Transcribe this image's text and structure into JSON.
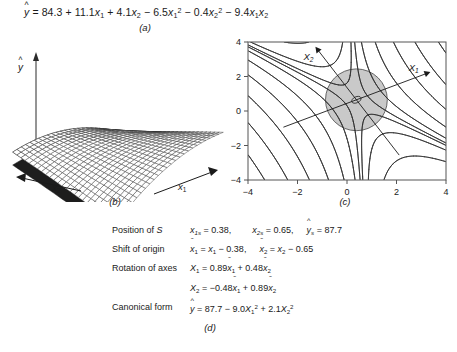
{
  "figure": {
    "panels": [
      "a",
      "b",
      "c",
      "d"
    ],
    "captions": {
      "a": "(a)",
      "b": "(b)",
      "c": "(c)",
      "d": "(d)"
    }
  },
  "equation_a": {
    "lhs": "ŷ",
    "text": "ŷ = 84.3 + 11.1x₁ + 4.1x₂ − 6.5x₁² − 0.4x₂² − 9.4x₁x₂",
    "intercept": "84.3",
    "terms": [
      {
        "coef": "11.1",
        "var": "x",
        "sub": "1",
        "pow": "",
        "sign": "+"
      },
      {
        "coef": "4.1",
        "var": "x",
        "sub": "2",
        "pow": "",
        "sign": "+"
      },
      {
        "coef": "6.5",
        "var": "x",
        "sub": "1",
        "pow": "2",
        "sign": "−"
      },
      {
        "coef": "0.4",
        "var": "x",
        "sub": "2",
        "pow": "2",
        "sign": "−"
      },
      {
        "coef": "9.4",
        "var": "x₁x₂",
        "sub": "",
        "pow": "",
        "sign": "−"
      }
    ]
  },
  "surface_b": {
    "y_axis_label": "ŷ",
    "x1_label": "x₁",
    "x2_label": "x₂",
    "description": "saddle-shaped response surface mesh"
  },
  "chart_data": {
    "type": "line",
    "title": "",
    "xlabel": "",
    "ylabel": "",
    "xlim": [
      -4,
      4
    ],
    "ylim": [
      -4,
      4
    ],
    "xticks": [
      "-4",
      "-2",
      "0",
      "2",
      "4"
    ],
    "yticks": [
      "4",
      "2",
      "0",
      "-2",
      "-4"
    ],
    "grid": false,
    "legend": null,
    "annotations": [
      {
        "text": "X₁",
        "x": 3.0,
        "y": 3.5,
        "kind": "axis-arrow-label"
      },
      {
        "text": "X₂",
        "x": -1.1,
        "y": 3.4,
        "kind": "axis-arrow-label"
      }
    ],
    "stationary_point": {
      "x1": 0.38,
      "x2": 0.65,
      "yhat": 87.7,
      "type": "saddle"
    },
    "shaded_region": {
      "shape": "circle",
      "cx": 0.38,
      "cy": 0.65,
      "r": 1.25,
      "color": "#c9c9c9"
    },
    "contour_family": "hyperbolic saddle contours of yhat",
    "rotation": {
      "X1": [
        0.89,
        0.48
      ],
      "X2": [
        -0.48,
        0.89
      ]
    }
  },
  "details_d": {
    "rows": [
      {
        "label": "Position of S",
        "value": "x₁ₛ = 0.38,    x₂ₛ = 0.65,  ŷₛ = 87.7",
        "parts": {
          "x1s": "0.38",
          "x2s": "0.65",
          "yhat_s": "87.7"
        }
      },
      {
        "label": "Shift of origin",
        "value": "x̃₁ = x₁ − 0.38,  x̃₂ = x₂ − 0.65",
        "parts": {
          "a": "0.38",
          "b": "0.65"
        }
      },
      {
        "label": "Rotation of axes",
        "value": "X₁ = 0.89x̃₁ + 0.48x̃₂",
        "parts": {
          "c1": "0.89",
          "c2": "0.48"
        }
      },
      {
        "label": "",
        "value": "X₂ = −0.48x̃₁ + 0.89x̃₂",
        "parts": {
          "c1": "-0.48",
          "c2": "0.89"
        }
      },
      {
        "label": "Canonical form",
        "value": "ŷ = 87.7 − 9.0X₁² + 2.1X₂²",
        "parts": {
          "const": "87.7",
          "l1": "-9.0",
          "l2": "2.1"
        }
      }
    ]
  },
  "colors": {
    "ink": "#1a1a1a",
    "mesh": "#2b2b2b",
    "shade": "#c7c7c7",
    "background": "#ffffff"
  }
}
